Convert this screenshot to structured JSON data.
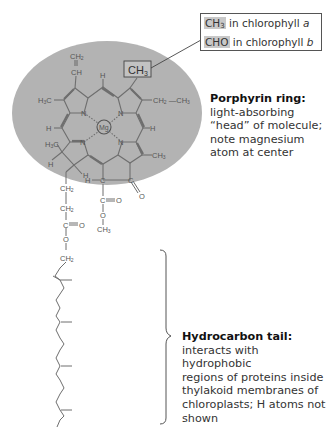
{
  "callout": {
    "line1_formula": "CH",
    "line1_sub": "3",
    "line1_text": " in chlorophyll ",
    "line1_variant": "a",
    "line2_formula": "CHO",
    "line2_text": " in chlorophyll ",
    "line2_variant": "b"
  },
  "porphyrin": {
    "title": "Porphyrin ring:",
    "lines": [
      "light-absorbing",
      "“head” of molecule;",
      "note magnesium",
      "atom at center"
    ]
  },
  "tail": {
    "title": "Hydrocarbon tail:",
    "lines": [
      "interacts with hydrophobic",
      "regions of proteins inside",
      "thylakoid membranes of",
      "chloroplasts; H atoms not",
      "shown"
    ]
  },
  "molecule": {
    "highlight_group": "CH3",
    "center_atom": "Mg",
    "atoms": {
      "vinyl_ch2": "CH2",
      "vinyl_ch": "CH",
      "top_h": "H",
      "left_h3c": "H3C",
      "right_ethyl": "CH2 —CH3",
      "n_tl": "N",
      "n_tr": "N",
      "n_bl": "N",
      "n_br": "N",
      "left_h": "H",
      "right_h": "H",
      "left_h3c_2": "H3C",
      "right_ch3": "CH3",
      "bottom_h1": "H",
      "bottom_h2": "H",
      "ch2_a": "CH2",
      "ch2_b": "CH2",
      "ester_c": "C",
      "ester_o_dbl": "O",
      "ester_o": "O",
      "ch2_c": "CH2",
      "h_c": "H",
      "keto_o": "O",
      "methylester_c": "C",
      "methylester_o_dbl": "O",
      "methylester_o": "O",
      "methylester_ch3": "CH3"
    }
  },
  "colors": {
    "head_fill": "#b3b3b3",
    "bond": "#6e6e6e",
    "formula_highlight": "#c8c8c8"
  }
}
